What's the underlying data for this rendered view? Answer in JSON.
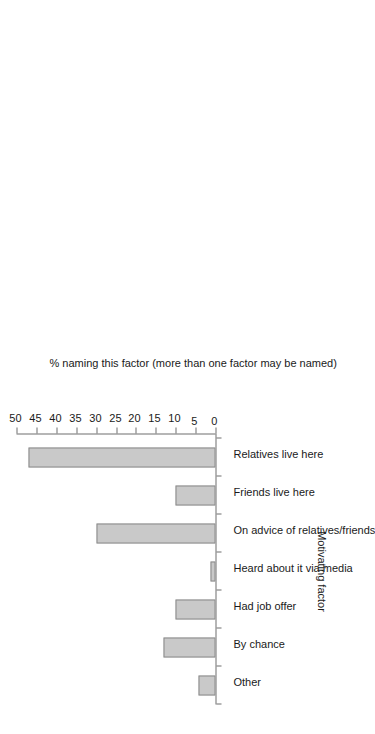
{
  "chart_data": {
    "type": "bar",
    "title": "",
    "subtitle": "",
    "orientation": "vertical-bars-rotated-90ccw",
    "categories": [
      "Other",
      "By chance",
      "Had job offer",
      "Heard about it via media",
      "On advice of relatives/friends",
      "Friends live here",
      "Relatives live here"
    ],
    "values": [
      4.2,
      13,
      10,
      1.2,
      30,
      10,
      47
    ],
    "xlabel": "Motivating factor",
    "ylabel": "% naming this factor (more than one factor may be named)",
    "ylim": [
      0,
      50
    ],
    "ytick_labels": [
      "0",
      "5",
      "10",
      "15",
      "20",
      "25",
      "30",
      "35",
      "40",
      "45",
      "50"
    ],
    "ytick_values": [
      0,
      5,
      10,
      15,
      20,
      25,
      30,
      35,
      40,
      45,
      50
    ],
    "grid": false,
    "legend": null,
    "bar_fill_color": "#c9c9c9",
    "bar_border_color": "#8a8a8a",
    "axis_color": "#6e6e6e",
    "background_color": "#ffffff"
  }
}
